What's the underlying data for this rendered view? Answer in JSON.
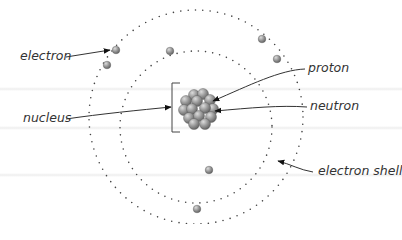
{
  "diagram": {
    "type": "atom-structure",
    "labels": {
      "electron": "electron",
      "proton": "proton",
      "neutron": "neutron",
      "nucleus": "nucleus",
      "electron_shell": "electron shell"
    },
    "colors": {
      "particle": "#8a8a8a",
      "particle_highlight": "#d0d0d0",
      "text": "#333333",
      "line": "#333333",
      "shell_dot": "#444444"
    },
    "shells": [
      {
        "name": "inner",
        "cx": 196,
        "cy": 127,
        "r": 76
      },
      {
        "name": "outer",
        "cx": 196,
        "cy": 117,
        "r": 107
      }
    ],
    "electrons": [
      {
        "x": 116,
        "y": 50
      },
      {
        "x": 107,
        "y": 65
      },
      {
        "x": 170,
        "y": 51
      },
      {
        "x": 262,
        "y": 39
      },
      {
        "x": 277,
        "y": 59
      },
      {
        "x": 209,
        "y": 170
      },
      {
        "x": 197,
        "y": 209
      }
    ]
  }
}
